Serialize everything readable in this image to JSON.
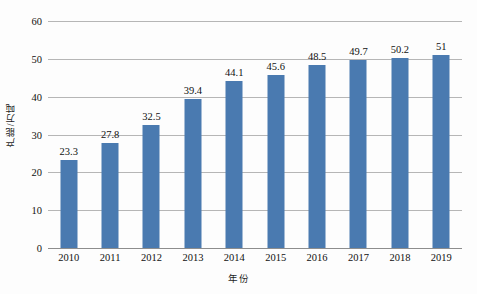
{
  "chart_data": {
    "type": "bar",
    "title": "",
    "xlabel": "年份",
    "ylabel": "产能/万吨",
    "categories": [
      "2010",
      "2011",
      "2012",
      "2013",
      "2014",
      "2015",
      "2016",
      "2017",
      "2018",
      "2019"
    ],
    "values": [
      23.3,
      27.8,
      32.5,
      39.4,
      44.1,
      45.6,
      48.5,
      49.7,
      50.2,
      51
    ],
    "value_labels": [
      "23.3",
      "27.8",
      "32.5",
      "39.4",
      "44.1",
      "45.6",
      "48.5",
      "49.7",
      "50.2",
      "51"
    ],
    "ylim": [
      0,
      60
    ],
    "yticks": [
      0,
      10,
      20,
      30,
      40,
      50,
      60
    ],
    "ytick_labels": [
      "0",
      "10",
      "20",
      "30",
      "40",
      "50",
      "60"
    ],
    "grid": true,
    "legend": false,
    "legend_position": "none",
    "series": [
      {
        "name": "产能",
        "values": [
          23.3,
          27.8,
          32.5,
          39.4,
          44.1,
          45.6,
          48.5,
          49.7,
          50.2,
          51
        ]
      }
    ]
  },
  "style": {
    "bar_color": "#4a7ab0",
    "gridline_color": "#b6b6b6",
    "axis_color": "#8d8d8d",
    "text_color": "#111111",
    "background": "#fdfdfd"
  }
}
